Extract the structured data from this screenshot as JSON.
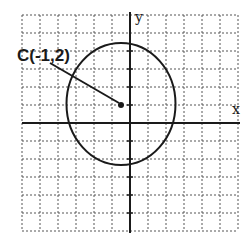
{
  "diagram": {
    "type": "coordinate-plane-circle",
    "center_label": "C(-1,2)",
    "center": {
      "x": -1,
      "y": 2
    },
    "axis_labels": {
      "x": "x",
      "y": "y"
    },
    "grid": {
      "dashed": true,
      "spacing_units": 1
    },
    "colors": {
      "stroke": "#1a1a1a",
      "grid": "#555555",
      "background": "#ffffff"
    }
  }
}
